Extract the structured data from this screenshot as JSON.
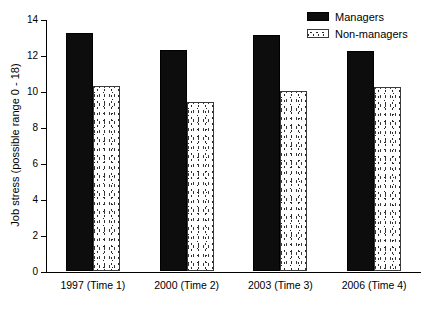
{
  "chart_data": {
    "type": "bar",
    "title": "",
    "xlabel": "",
    "ylabel": "Job stress (possible range 0 - 18)",
    "categories": [
      "1997 (Time 1)",
      "2000 (Time 2)",
      "2003 (Time 3)",
      "2006 (Time 4)"
    ],
    "series": [
      {
        "name": "Managers",
        "values": [
          13.2,
          12.3,
          13.1,
          12.2
        ],
        "color": "#0d0d0d",
        "fill": "solid-black"
      },
      {
        "name": "Non-managers",
        "values": [
          10.3,
          9.4,
          10.0,
          10.2
        ],
        "color": "#ffffff",
        "fill": "stippled-dots"
      }
    ],
    "ylim": [
      0,
      14
    ],
    "yticks": [
      0,
      2,
      4,
      6,
      8,
      10,
      12,
      14
    ],
    "ytick_labels": [
      "0",
      "2",
      "4",
      "6",
      "8",
      "10",
      "12",
      "14"
    ],
    "grid": false,
    "legend_position": "top-right",
    "axis_spines": [
      "left",
      "bottom"
    ]
  },
  "legend": {
    "items": [
      {
        "label": "Managers",
        "swatch": "solid-black-swatch"
      },
      {
        "label": "Non-managers",
        "swatch": "stippled-swatch"
      }
    ]
  }
}
